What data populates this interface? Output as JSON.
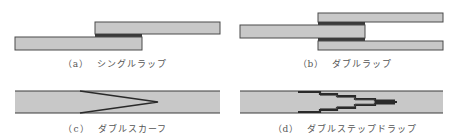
{
  "colors": {
    "plate_fill": "#c8c8c8",
    "plate_edge": "#4a4a4a",
    "adhesive": "#3a3a3a",
    "caption": "#555555",
    "background": "#ffffff"
  },
  "panels": [
    {
      "id": "a",
      "label_num": "（a）",
      "label_text": "シングルラップ",
      "joint_type": "single-lap"
    },
    {
      "id": "b",
      "label_num": "（b）",
      "label_text": "ダブルラップ",
      "joint_type": "double-lap"
    },
    {
      "id": "c",
      "label_num": "（c）",
      "label_text": "ダブルスカーフ",
      "joint_type": "double-scarf"
    },
    {
      "id": "d",
      "label_num": "（d）",
      "label_text": "ダブルステップドラップ",
      "joint_type": "double-stepped-lap"
    }
  ]
}
